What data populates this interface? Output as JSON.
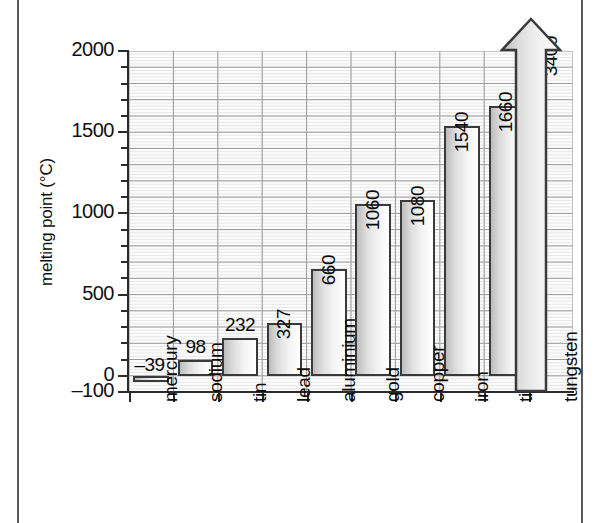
{
  "chart_data": {
    "type": "bar",
    "title": "",
    "xlabel": "",
    "ylabel": "melting point (°C)",
    "categories": [
      "mercury",
      "sodium",
      "tin",
      "lead",
      "aluminium",
      "gold",
      "copper",
      "iron",
      "titanium",
      "tungsten"
    ],
    "values": [
      -39,
      98,
      232,
      327,
      660,
      1060,
      1080,
      1540,
      1660,
      3400
    ],
    "value_labels": [
      "–39",
      "98",
      "232",
      "327",
      "660",
      "1060",
      "1080",
      "1540",
      "1660",
      "3400"
    ],
    "ylim": [
      -100,
      2000
    ],
    "y_major_ticks": [
      -100,
      0,
      500,
      1000,
      1500,
      2000
    ],
    "y_major_tick_labels": [
      "–100",
      "0",
      "500",
      "1000",
      "1500",
      "2000"
    ],
    "y_minor_tick_step": 100,
    "grid": true,
    "legend": null,
    "overflow_series_index": 9
  },
  "figure": {
    "y_axis_title": "melting point (°C)",
    "colors": {
      "bar_outline": "#3a3a3a",
      "bar_fill_dark": "#bdbdbd",
      "bar_fill_light": "#ffffff",
      "axis": "#2b2b2b",
      "grid_major": "#9a9a9a",
      "grid_minor": "#d8d8d8",
      "plot_background": "#fcfcfc",
      "page_rule": "#5a5a5a",
      "text": "#0b0b0b"
    }
  }
}
